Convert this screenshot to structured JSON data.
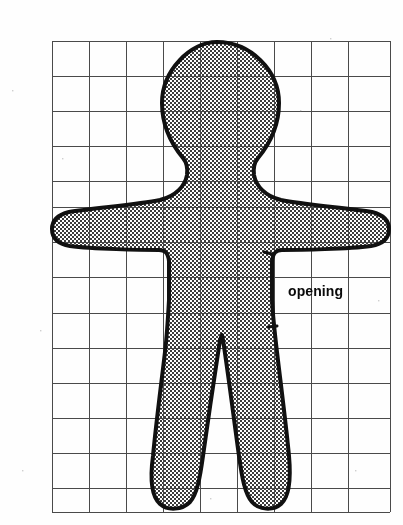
{
  "document": {
    "type": "sewing-pattern-diagram",
    "title": "Gingerbread / doll body sewing pattern on grid",
    "background_color": "#fefefe"
  },
  "grid": {
    "x_left": 52,
    "x_right": 390,
    "y_top": 41,
    "y_bottom": 512,
    "columns": 9,
    "rows": 13,
    "vertical_lines": [
      52,
      89,
      126,
      163,
      200,
      237,
      274,
      311,
      348,
      390
    ],
    "horizontal_lines": [
      41,
      76,
      111,
      146,
      181,
      207,
      242,
      277,
      313,
      348,
      383,
      418,
      453,
      488,
      512
    ],
    "line_color": "#4a4a4a",
    "line_width": 1
  },
  "figure": {
    "name": "doll-body-outline",
    "outline_color": "#111111",
    "outline_width": 4,
    "fill_pattern": "checkerboard-halftone",
    "fill_color": "#b5b5b5",
    "fill_background": "#efefef"
  },
  "annotations": {
    "opening": {
      "label": "opening",
      "text_x": 288,
      "text_y": 283,
      "font_size": 14,
      "color": "#0a0a0a",
      "tick_top": {
        "x": 264,
        "y": 252
      },
      "tick_bottom": {
        "x": 268,
        "y": 327
      }
    }
  },
  "colors": {
    "ink": "#111111",
    "grid": "#4a4a4a",
    "paper": "#fefefe",
    "shade": "#b5b5b5"
  }
}
